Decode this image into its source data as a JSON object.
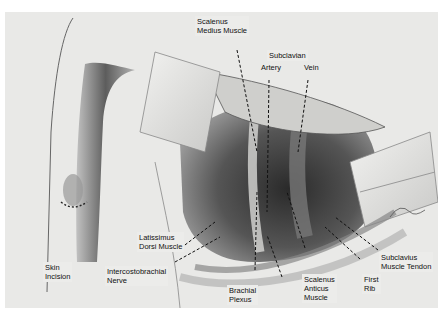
{
  "figure": {
    "labels": [
      {
        "id": "scalenus-medius",
        "line1": "Scalenus",
        "line2": "Medius Muscle"
      },
      {
        "id": "subclavian",
        "line1": "Subclavian",
        "line2": ""
      },
      {
        "id": "artery",
        "line1": "Artery",
        "line2": ""
      },
      {
        "id": "vein",
        "line1": "Vein",
        "line2": ""
      },
      {
        "id": "latissimus-dorsi",
        "line1": "Latissimus",
        "line2": "Dorsi Muscle"
      },
      {
        "id": "skin-incision",
        "line1": "Skin",
        "line2": "Incision"
      },
      {
        "id": "intercostobrachial",
        "line1": "Intercostobrachial",
        "line2": "Nerve"
      },
      {
        "id": "brachial-plexus",
        "line1": "Brachial",
        "line2": "Plexus"
      },
      {
        "id": "second-rib",
        "line1": "Second Rib",
        "line2": ""
      },
      {
        "id": "scalenus-anticus",
        "line1": "Scalenus",
        "line2": "Anticus",
        "line3": "Muscle"
      },
      {
        "id": "first-rib",
        "line1": "First",
        "line2": "Rib"
      },
      {
        "id": "subclavius-tendon",
        "line1": "Subclavius",
        "line2": "Muscle Tendon"
      }
    ]
  }
}
